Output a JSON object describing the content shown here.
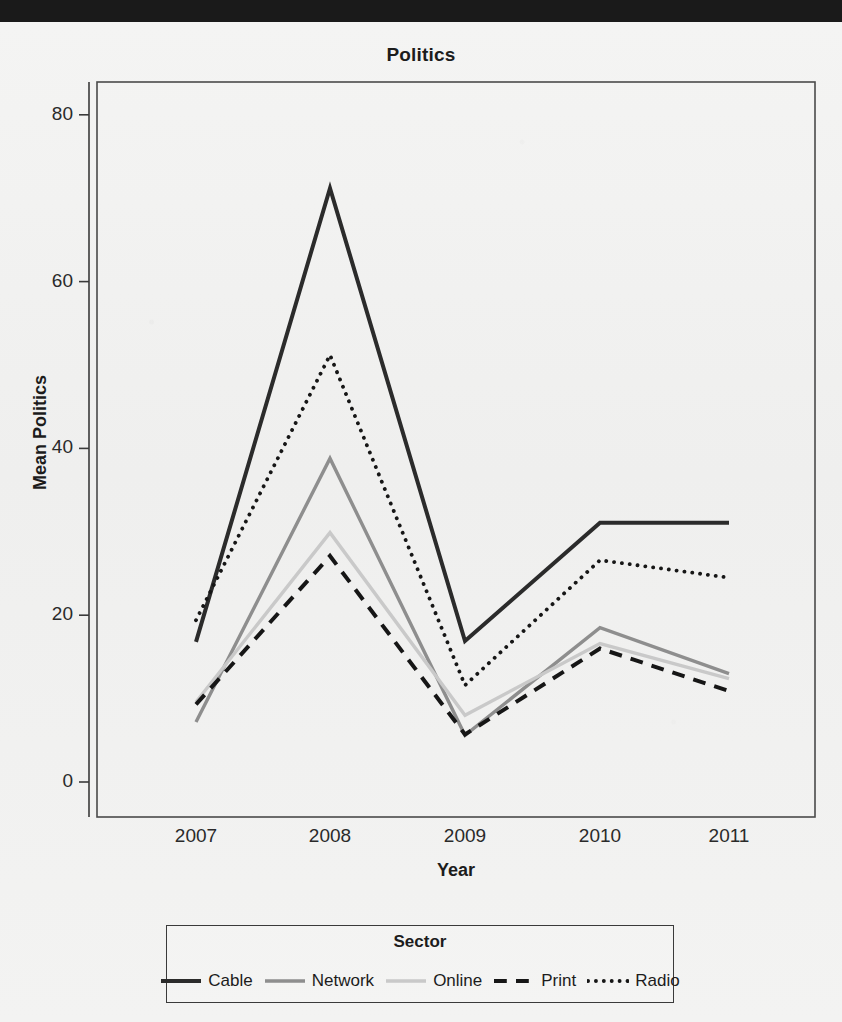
{
  "window": {
    "top_bar_color": "#1a1a1a"
  },
  "chart_data": {
    "type": "line",
    "title": "Politics",
    "xlabel": "Year",
    "ylabel": "Mean Politics",
    "x": [
      "2007",
      "2008",
      "2009",
      "2010",
      "2011"
    ],
    "categories": [
      "2007",
      "2008",
      "2009",
      "2010",
      "2011"
    ],
    "yticks": [
      0,
      20,
      40,
      60,
      80
    ],
    "ylim": [
      -3,
      85
    ],
    "grid": false,
    "legend_title": "Sector",
    "legend_position": "bottom",
    "series": [
      {
        "name": "Cable",
        "values": [
          16.8,
          71.2,
          16.9,
          31.1,
          31.1
        ],
        "color": "#2b2b2b",
        "style": "solid",
        "width": 4.0
      },
      {
        "name": "Network",
        "values": [
          7.2,
          38.8,
          5.6,
          18.5,
          13.0
        ],
        "color": "#8e8e8e",
        "style": "solid",
        "width": 3.4
      },
      {
        "name": "Online",
        "values": [
          9.6,
          29.9,
          8.0,
          16.6,
          12.4
        ],
        "color": "#c9c9c9",
        "style": "solid",
        "width": 3.4
      },
      {
        "name": "Print",
        "values": [
          9.3,
          27.1,
          5.7,
          16.0,
          10.9
        ],
        "color": "#161616",
        "style": "dashed",
        "width": 4.0
      },
      {
        "name": "Radio",
        "values": [
          19.4,
          51.2,
          11.6,
          26.6,
          24.5
        ],
        "color": "#161616",
        "style": "dotted",
        "width": 3.8
      }
    ]
  },
  "axes": {
    "y_tick_labels": [
      "80",
      "60",
      "40",
      "20",
      "0"
    ],
    "x_tick_labels": [
      "2007",
      "2008",
      "2009",
      "2010",
      "2011"
    ]
  }
}
